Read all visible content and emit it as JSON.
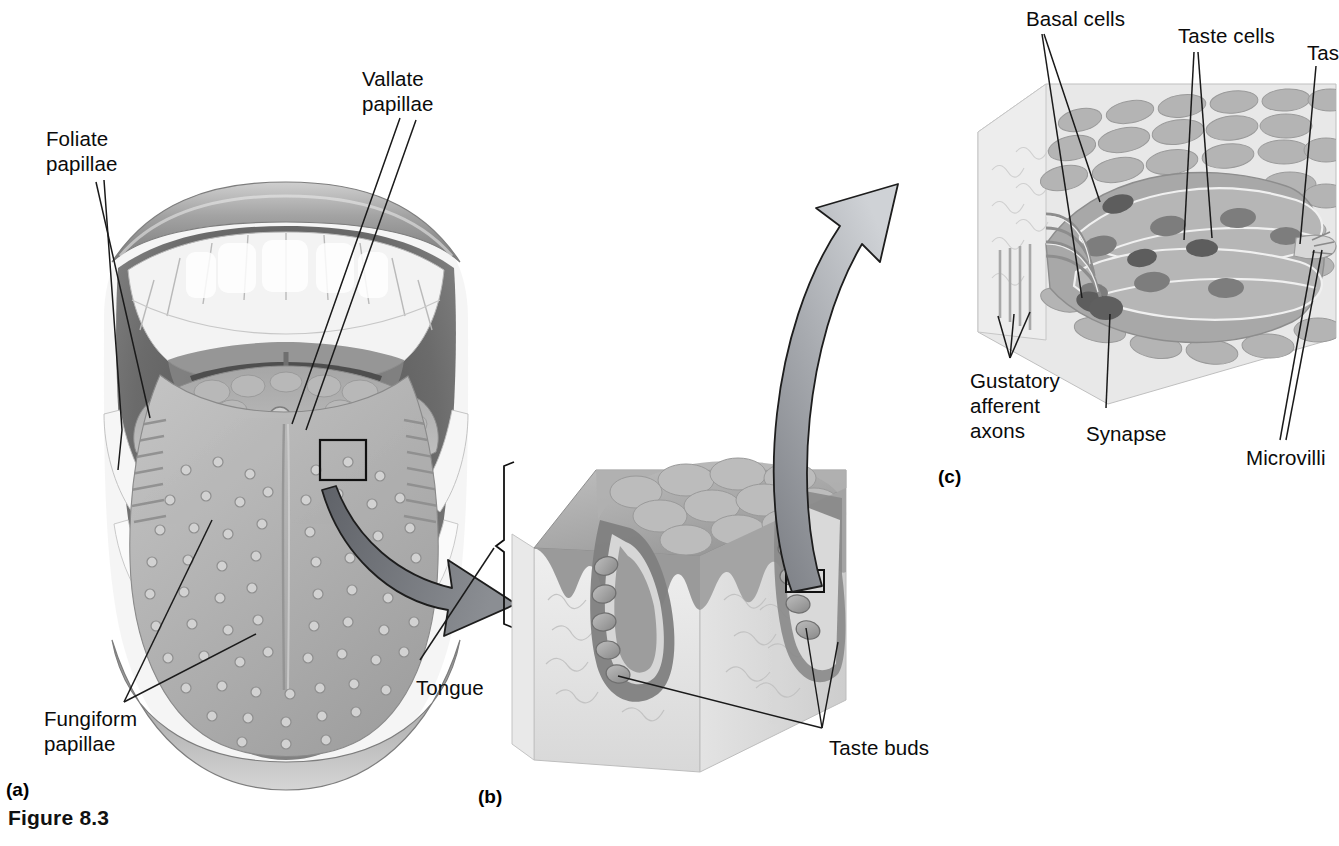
{
  "figure": {
    "number_label": "Figure 8.3",
    "panels": [
      {
        "id": "a",
        "id_label": "(a)"
      },
      {
        "id": "b",
        "id_label": "(b)"
      },
      {
        "id": "c",
        "id_label": "(c)"
      }
    ]
  },
  "labels": {
    "panel_a": [
      {
        "name": "foliate-papillae",
        "text": "Foliate\npapillae",
        "x": 46,
        "y": 126
      },
      {
        "name": "vallate-papillae",
        "text": "Vallate\npapillae",
        "x": 362,
        "y": 66
      },
      {
        "name": "fungiform-papillae",
        "text": "Fungiform\npapillae",
        "x": 44,
        "y": 706
      }
    ],
    "panel_b": [
      {
        "name": "tongue",
        "text": "Tongue",
        "x": 416,
        "y": 675
      },
      {
        "name": "taste-buds",
        "text": "Taste buds",
        "x": 829,
        "y": 735
      }
    ],
    "panel_c": [
      {
        "name": "basal-cells",
        "text": "Basal cells",
        "x": 1026,
        "y": 6
      },
      {
        "name": "taste-cells",
        "text": "Taste cells",
        "x": 1178,
        "y": 23
      },
      {
        "name": "taste-pore-clipped",
        "text": "Tas",
        "x": 1307,
        "y": 40
      },
      {
        "name": "gustatory-afferent-axons",
        "text": "Gustatory\nafferent\naxons",
        "x": 970,
        "y": 368
      },
      {
        "name": "synapse",
        "text": "Synapse",
        "x": 1086,
        "y": 421
      },
      {
        "name": "microvilli",
        "text": "Microvilli",
        "x": 1246,
        "y": 445
      }
    ]
  },
  "panel_positions": {
    "a": {
      "x": 6,
      "y": 779
    },
    "b": {
      "x": 478,
      "y": 786
    },
    "c": {
      "x": 938,
      "y": 466
    }
  },
  "figure_title_position": {
    "x": 8,
    "y": 806
  },
  "colors": {
    "ink": "#0b0b0b",
    "leader_line": "#1a1a1a",
    "arrow_fill_dark": "#6f7277",
    "arrow_fill_light": "#c9ccd1",
    "tissue_mid": "#9b9b9b",
    "tissue_light": "#cfcfcf",
    "tissue_dark": "#6e6e6e",
    "tissue_pale": "#e6e6e6",
    "lip": "#8e8e8e",
    "tooth": "#fbfbfb",
    "oral_shadow": "#5a5a5a",
    "background": "#ffffff"
  }
}
